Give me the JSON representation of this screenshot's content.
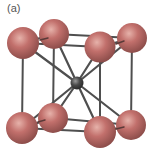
{
  "figure": {
    "panel_label": "(a)",
    "structure": "body-centered cubic unit cell",
    "colors": {
      "corner_atom": "#C2706C",
      "corner_atom_highlight": "#E6B2AA",
      "corner_atom_shadow": "#8E4E4B",
      "center_atom": "#4A4A4A",
      "center_atom_highlight": "#9A9A9A",
      "bond": "#4F4F4F",
      "background": "#FFFFFF"
    },
    "atoms": {
      "corners": [
        {
          "id": "top-back-left",
          "cx": 54,
          "cy": 34,
          "r": 15
        },
        {
          "id": "top-back-right",
          "cx": 132,
          "cy": 38,
          "r": 15
        },
        {
          "id": "top-front-left",
          "cx": 23,
          "cy": 43,
          "r": 16
        },
        {
          "id": "top-front-right",
          "cx": 100,
          "cy": 47,
          "r": 15.5
        },
        {
          "id": "bottom-back-left",
          "cx": 53,
          "cy": 118,
          "r": 15
        },
        {
          "id": "bottom-back-right",
          "cx": 131,
          "cy": 125,
          "r": 15
        },
        {
          "id": "bottom-front-left",
          "cx": 22,
          "cy": 128,
          "r": 16
        },
        {
          "id": "bottom-front-right",
          "cx": 100,
          "cy": 132,
          "r": 16
        }
      ],
      "center": {
        "id": "body-center",
        "cx": 77,
        "cy": 83,
        "r": 6.5
      }
    }
  }
}
